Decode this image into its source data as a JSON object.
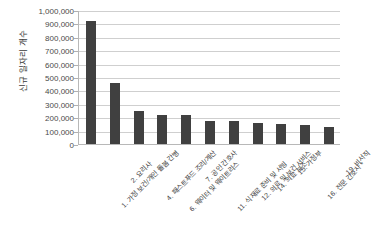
{
  "chart_data": {
    "type": "bar",
    "title": "",
    "xlabel": "",
    "ylabel": "신규 일자리 개수",
    "ylim": [
      0,
      1000000
    ],
    "ytick_values": [
      0,
      100000,
      200000,
      300000,
      400000,
      500000,
      600000,
      700000,
      800000,
      900000,
      1000000
    ],
    "ytick_labels": [
      "0",
      "100,000",
      "200,000",
      "300,000",
      "400,000",
      "500,000",
      "600,000",
      "700,000",
      "800,000",
      "900,000",
      "1,000,000"
    ],
    "grid": true,
    "legend": false,
    "bar_color": "#404040",
    "categories": [
      "1. 가정 보건/개인 돌봄 간병",
      "2. 요리사",
      "4. 패스트푸드 조리/계산",
      "6. 웨이터 및 웨이트리스",
      "7. 공인 간호사",
      "11. 식재료 준비 및 서빙",
      "12. 의료 및 보건 서비스",
      "14. 의료 보조",
      "15. 가정부",
      "16. 전문 간호사 *",
      "19. 비서직"
    ],
    "values": [
      920000,
      455000,
      250000,
      215000,
      215000,
      175000,
      170000,
      155000,
      150000,
      145000,
      130000
    ]
  },
  "watermark": "",
  "axis": {
    "y_title": "신규 일자리 개수"
  }
}
